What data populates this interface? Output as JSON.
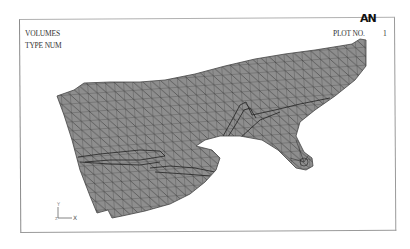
{
  "plot": {
    "title_line1": "VOLUMES",
    "title_line2": "TYPE NUM",
    "logo": "AN",
    "plot_no_label": "PLOT NO.",
    "plot_no_value": "1"
  },
  "triad": {
    "x_label": "X",
    "y_label": "Y",
    "z_label": "Z"
  },
  "colors": {
    "mesh_fill": "#8c8c8c",
    "mesh_lines": "#2f2f2f",
    "frame": "#9a9a9a",
    "background": "#ffffff"
  }
}
